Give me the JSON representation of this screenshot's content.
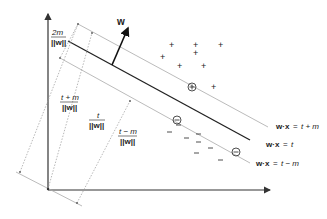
{
  "diagram": {
    "vector_label": "w",
    "plus_marker": "+",
    "minus_marker": "−",
    "plus_points_count": 8,
    "minus_points_count": 8,
    "support_vectors": {
      "positive": "⊕",
      "negative": "⊖"
    },
    "hyperplanes": [
      {
        "id": "upper",
        "lhs": "w·x",
        "eq": "=",
        "rhs": "t + m"
      },
      {
        "id": "decision",
        "lhs": "w·x",
        "eq": "=",
        "rhs": "t"
      },
      {
        "id": "lower",
        "lhs": "w·x",
        "eq": "=",
        "rhs": "t − m"
      }
    ],
    "distances": [
      {
        "id": "margin",
        "numerator": "2m",
        "denominator": "||w||"
      },
      {
        "id": "upper",
        "numerator": "t + m",
        "denominator": "||w||"
      },
      {
        "id": "decision",
        "numerator": "t",
        "denominator": "||w||"
      },
      {
        "id": "lower",
        "numerator": "t − m",
        "denominator": "||w||"
      }
    ],
    "colors": {
      "axis": "#333333",
      "decision_line": "#222222",
      "margin_line": "#aaaaaa",
      "dotted": "#999999",
      "text": "#222222"
    }
  }
}
